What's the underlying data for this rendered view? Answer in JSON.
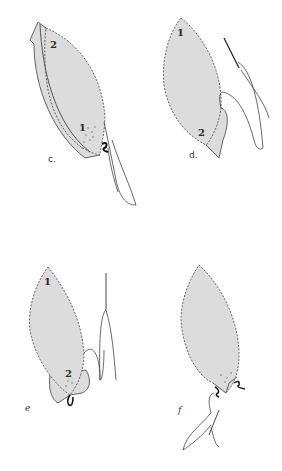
{
  "figure": {
    "colors": {
      "fill": "#dcdcdc",
      "stroke": "#555555",
      "thread": "#444444",
      "background": "#ffffff"
    },
    "panels": [
      {
        "id": "c",
        "caption": "c.",
        "labels": [
          "2",
          "1"
        ]
      },
      {
        "id": "d",
        "caption": "d.",
        "labels": [
          "1",
          "2"
        ]
      },
      {
        "id": "e",
        "caption": "e",
        "labels": [
          "1",
          "2"
        ]
      },
      {
        "id": "f",
        "caption": "f",
        "labels": []
      }
    ]
  }
}
